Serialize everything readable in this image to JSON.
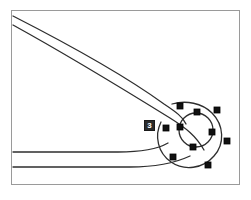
{
  "canvas": {
    "width": 251,
    "height": 200,
    "background_color": "#ffffff",
    "frame": {
      "x": 11,
      "y": 10,
      "width": 229,
      "height": 175,
      "stroke_color": "#9a9a9a",
      "stroke_width": 1,
      "fill_color": "#ffffff"
    }
  },
  "colors": {
    "outline_stroke": "#2e2e2e",
    "handle_fill": "#111111",
    "handle_stroke": "#000000",
    "badge_background": "#2b2b2b",
    "badge_text": "#ffffff",
    "frame_stroke": "#9a9a9a"
  },
  "shape": {
    "name": "wrench-head-outline",
    "description": "open-end wrench arm converging into an annular ring head",
    "stroke_width": 1.3,
    "paths": [
      {
        "name": "upper-arm-edge",
        "d": "M 13 16 C 60 40, 120 72, 164 104 C 176 112, 183 117, 186 124"
      },
      {
        "name": "lower-arm-edge",
        "d": "M 13 25 C 62 52, 128 92, 170 118 C 186 128, 196 136, 204 150"
      },
      {
        "name": "upper-inner-return",
        "d": "M 13 152 L 118 152 C 140 152, 156 150, 168 143"
      },
      {
        "name": "lower-inner-return",
        "d": "M 13 167 L 130 167 C 155 167, 175 163, 190 156"
      }
    ],
    "outer_ring": {
      "name": "ring-head-outer",
      "cx": 196,
      "cy": 130,
      "rx": 31,
      "ry": 31,
      "d": "M 172 104 C 186 100, 202 103, 212 113 C 224 125, 225 144, 214 156 C 203 169, 184 171, 171 162 C 158 153, 154 136, 161 122 C 164 115, 167 109, 172 104 Z"
    },
    "inner_ring": {
      "name": "ring-head-bore",
      "cx": 196,
      "cy": 130,
      "r": 17
    }
  },
  "selection": {
    "active": true,
    "handle_size": 6,
    "handle_shape": "square",
    "outer_handles": [
      {
        "name": "handle-outer-top-left",
        "x": 180,
        "y": 106
      },
      {
        "name": "handle-outer-top-right",
        "x": 217,
        "y": 110
      },
      {
        "name": "handle-outer-left",
        "x": 166,
        "y": 128
      },
      {
        "name": "handle-outer-right",
        "x": 227,
        "y": 141
      },
      {
        "name": "handle-outer-bottom-left",
        "x": 173,
        "y": 157
      },
      {
        "name": "handle-outer-bottom-right",
        "x": 208,
        "y": 165
      }
    ],
    "inner_handles": [
      {
        "name": "handle-inner-top",
        "x": 197,
        "y": 112
      },
      {
        "name": "handle-inner-left",
        "x": 180,
        "y": 127
      },
      {
        "name": "handle-inner-right",
        "x": 212,
        "y": 132
      },
      {
        "name": "handle-inner-bottom",
        "x": 193,
        "y": 147
      }
    ]
  },
  "annotations": {
    "badge": {
      "name": "node-index-badge",
      "text": "3",
      "x": 144,
      "y": 120,
      "width": 11,
      "height": 11
    }
  }
}
